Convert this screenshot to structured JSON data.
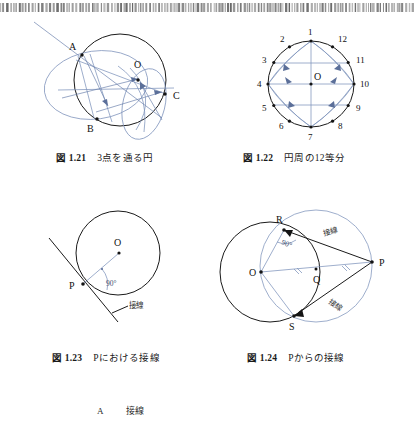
{
  "page": {
    "background_color": "#ffffff",
    "ink_color": "#1a1a1a",
    "construction_color": "#7e93bb",
    "scan_artifact": "barcode-scan-strip"
  },
  "figures": [
    {
      "id": "fig-1-21",
      "caption_number": "図 1.21",
      "caption_text": "3点を通る円",
      "point_labels": [
        "A",
        "O",
        "B",
        "C"
      ],
      "description": "circle through three points with compass arcs"
    },
    {
      "id": "fig-1-22",
      "caption_number": "図 1.22",
      "caption_text": "円周の12等分",
      "center_label": "O",
      "point_labels": [
        "1",
        "2",
        "3",
        "4",
        "5",
        "6",
        "7",
        "8",
        "9",
        "10",
        "11",
        "12"
      ],
      "description": "circle divided into twelve equal arcs"
    },
    {
      "id": "fig-1-23",
      "caption_number": "図 1.23",
      "caption_text": "Pにおける接線",
      "point_labels": [
        "O",
        "P"
      ],
      "angle_label": "90°",
      "tangent_label": "接線",
      "description": "tangent line at point P perpendicular to radius OP"
    },
    {
      "id": "fig-1-24",
      "caption_number": "図 1.24",
      "caption_text": "Pからの接線",
      "point_labels": [
        "R",
        "O",
        "Q",
        "P",
        "S"
      ],
      "angle_label": "90°",
      "tangent_labels": [
        "接線",
        "接線"
      ],
      "description": "two tangent lines from external point P using Thales circle on OP"
    }
  ],
  "bottom_note": {
    "label": "A",
    "text": "接線"
  }
}
